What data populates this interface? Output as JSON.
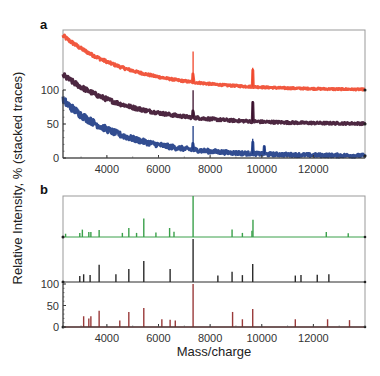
{
  "figure": {
    "ylabel": "Relative Intensity, % (stacked traces)",
    "xlabel": "Mass/charge"
  },
  "chart_data": [
    {
      "panel": "a",
      "type": "line",
      "title": "",
      "xlabel": "",
      "ylabel": "Relative Intensity, % (stacked traces)",
      "xlim": [
        2300,
        14000
      ],
      "ylim": [
        0,
        180
      ],
      "xticks": [
        4000,
        6000,
        8000,
        10000,
        12000
      ],
      "yticks": [
        0,
        50,
        100
      ],
      "grid": false,
      "legend": null,
      "series": [
        {
          "name": "trace-1 (red, offset 100)",
          "color": "#f0462a",
          "offset": 100,
          "baseline_decay": {
            "start": 80,
            "end": 0,
            "tau": 2600
          },
          "noise": 5,
          "peaks": [
            {
              "x": 7340,
              "h": 45
            },
            {
              "x": 9650,
              "h": 28
            }
          ]
        },
        {
          "name": "trace-2 (dark purple, offset 50)",
          "color": "#3a0f2c",
          "offset": 50,
          "baseline_decay": {
            "start": 72,
            "end": 0,
            "tau": 2500
          },
          "noise": 8,
          "peaks": [
            {
              "x": 7340,
              "h": 40
            },
            {
              "x": 9650,
              "h": 30
            }
          ]
        },
        {
          "name": "trace-3 (navy, offset 0)",
          "color": "#1c3a85",
          "offset": 0,
          "baseline_decay": {
            "start": 85,
            "end": 3,
            "tau": 2300
          },
          "noise": 12,
          "peaks": [
            {
              "x": 7340,
              "h": 35
            },
            {
              "x": 9650,
              "h": 22
            },
            {
              "x": 10100,
              "h": 12
            }
          ]
        }
      ]
    },
    {
      "panel": "b",
      "type": "bar",
      "title": "",
      "xlabel": "Mass/charge",
      "ylabel": "Relative Intensity, % (stacked traces)",
      "xlim": [
        2300,
        14000
      ],
      "ylim": [
        0,
        220
      ],
      "xticks": [
        4000,
        6000,
        8000,
        10000,
        12000
      ],
      "yticks": [
        0,
        50,
        100
      ],
      "grid": false,
      "legend": null,
      "series": [
        {
          "name": "stick-spectrum-1 (green, offset 220)",
          "color": "#3aa04a",
          "offset": 220,
          "peaks": [
            {
              "x": 2400,
              "h": 8
            },
            {
              "x": 2950,
              "h": 10
            },
            {
              "x": 3050,
              "h": 18
            },
            {
              "x": 3300,
              "h": 12
            },
            {
              "x": 3380,
              "h": 12
            },
            {
              "x": 3700,
              "h": 17
            },
            {
              "x": 4600,
              "h": 10
            },
            {
              "x": 4850,
              "h": 22
            },
            {
              "x": 5150,
              "h": 10
            },
            {
              "x": 5430,
              "h": 45
            },
            {
              "x": 5900,
              "h": 11
            },
            {
              "x": 6430,
              "h": 22
            },
            {
              "x": 6600,
              "h": 13
            },
            {
              "x": 7340,
              "h": 100
            },
            {
              "x": 8850,
              "h": 18
            },
            {
              "x": 9250,
              "h": 10
            },
            {
              "x": 9620,
              "h": 15
            },
            {
              "x": 9660,
              "h": 42
            },
            {
              "x": 12500,
              "h": 12
            },
            {
              "x": 13350,
              "h": 9
            }
          ]
        },
        {
          "name": "stick-spectrum-2 (black, offset 110)",
          "color": "#2a2a2a",
          "offset": 110,
          "peaks": [
            {
              "x": 2950,
              "h": 14
            },
            {
              "x": 3100,
              "h": 18
            },
            {
              "x": 3350,
              "h": 16
            },
            {
              "x": 3700,
              "h": 40
            },
            {
              "x": 4350,
              "h": 18
            },
            {
              "x": 4850,
              "h": 30
            },
            {
              "x": 5430,
              "h": 49
            },
            {
              "x": 6450,
              "h": 30
            },
            {
              "x": 7340,
              "h": 100
            },
            {
              "x": 8300,
              "h": 15
            },
            {
              "x": 8850,
              "h": 24
            },
            {
              "x": 9250,
              "h": 16
            },
            {
              "x": 9650,
              "h": 42
            },
            {
              "x": 11300,
              "h": 15
            },
            {
              "x": 11520,
              "h": 16
            },
            {
              "x": 12150,
              "h": 17
            },
            {
              "x": 12600,
              "h": 18
            }
          ]
        },
        {
          "name": "stick-spectrum-3 (brown-red, offset 0)",
          "color": "#9a3a3a",
          "offset": 0,
          "peaks": [
            {
              "x": 3100,
              "h": 25
            },
            {
              "x": 3300,
              "h": 20
            },
            {
              "x": 3380,
              "h": 25
            },
            {
              "x": 3700,
              "h": 38
            },
            {
              "x": 4500,
              "h": 15
            },
            {
              "x": 4850,
              "h": 35
            },
            {
              "x": 5430,
              "h": 44
            },
            {
              "x": 6130,
              "h": 18
            },
            {
              "x": 6450,
              "h": 17
            },
            {
              "x": 6650,
              "h": 15
            },
            {
              "x": 7340,
              "h": 100
            },
            {
              "x": 8870,
              "h": 35
            },
            {
              "x": 9250,
              "h": 18
            },
            {
              "x": 9650,
              "h": 42
            },
            {
              "x": 11300,
              "h": 18
            },
            {
              "x": 12550,
              "h": 18
            },
            {
              "x": 13400,
              "h": 16
            }
          ]
        }
      ]
    }
  ]
}
